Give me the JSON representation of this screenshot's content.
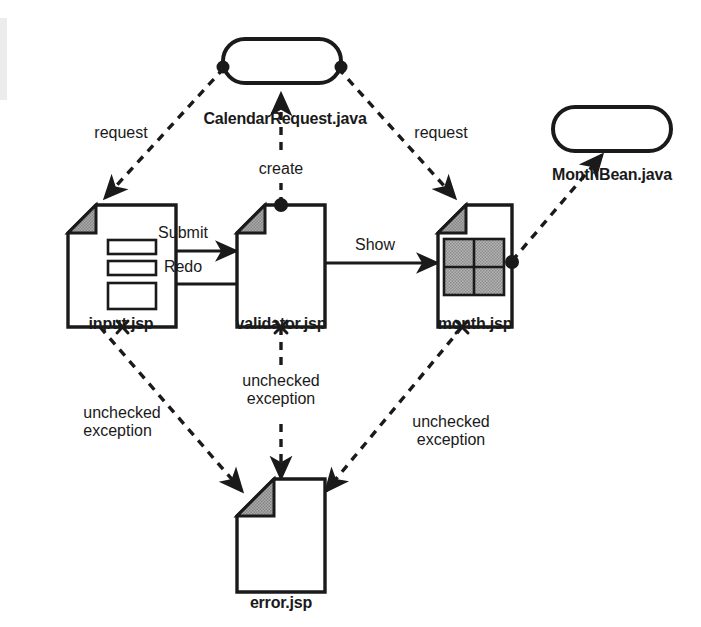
{
  "diagram": {
    "type": "uml-component-navigation",
    "colors": {
      "stroke": "#1a1a1a",
      "background": "#ffffff",
      "fold_fill": "#9a9a9a",
      "grid_fill": "#a8a8a8",
      "text": "#1a1a1a"
    },
    "nodes": [
      {
        "id": "calendarRequest",
        "label": "CalendarRequest.java",
        "shape": "rounded-rectangle",
        "kind": "java-bean"
      },
      {
        "id": "monthBean",
        "label": "MonthBean.java",
        "shape": "rounded-rectangle",
        "kind": "java-bean"
      },
      {
        "id": "inputJsp",
        "label": "input.jsp",
        "shape": "document",
        "kind": "jsp-page",
        "contents": "form-fields"
      },
      {
        "id": "validatorJsp",
        "label": "validator.jsp",
        "shape": "document",
        "kind": "jsp-page",
        "contents": "empty"
      },
      {
        "id": "monthJsp",
        "label": "month.jsp",
        "shape": "document",
        "kind": "jsp-page",
        "contents": "calendar-grid"
      },
      {
        "id": "errorJsp",
        "label": "error.jsp",
        "shape": "document",
        "kind": "jsp-page",
        "contents": "empty"
      }
    ],
    "edges": [
      {
        "id": "e1",
        "from": "calendarRequest",
        "to": "inputJsp",
        "label": "request",
        "style": "dashed"
      },
      {
        "id": "e2",
        "from": "calendarRequest",
        "to": "monthJsp",
        "label": "request",
        "style": "dashed"
      },
      {
        "id": "e3",
        "from": "validatorJsp",
        "to": "calendarRequest",
        "label": "create",
        "style": "dashed"
      },
      {
        "id": "e4",
        "from": "monthJsp",
        "to": "monthBean",
        "label": "",
        "style": "dashed"
      },
      {
        "id": "e5",
        "from": "inputJsp",
        "to": "validatorJsp",
        "label": "Submit",
        "style": "solid"
      },
      {
        "id": "e6",
        "from": "validatorJsp",
        "to": "inputJsp",
        "label": "Redo",
        "style": "solid"
      },
      {
        "id": "e7",
        "from": "validatorJsp",
        "to": "monthJsp",
        "label": "Show",
        "style": "solid"
      },
      {
        "id": "e8",
        "from": "inputJsp",
        "to": "errorJsp",
        "label": "unchecked exception",
        "style": "dashed"
      },
      {
        "id": "e9",
        "from": "validatorJsp",
        "to": "errorJsp",
        "label": "unchecked exception",
        "style": "dashed"
      },
      {
        "id": "e10",
        "from": "monthJsp",
        "to": "errorJsp",
        "label": "unchecked exception",
        "style": "dashed"
      }
    ],
    "labels": {
      "calendar_request": "CalendarRequest.java",
      "month_bean": "MonthBean.java",
      "input_jsp": "input.jsp",
      "validator_jsp": "validator.jsp",
      "month_jsp": "month.jsp",
      "error_jsp": "error.jsp",
      "request_left": "request",
      "request_right": "request",
      "create": "create",
      "submit": "Submit",
      "redo": "Redo",
      "show": "Show",
      "unchecked_exception_left_l1": "unchecked",
      "unchecked_exception_left_l2": "exception",
      "unchecked_exception_mid_l1": "unchecked",
      "unchecked_exception_mid_l2": "exception",
      "unchecked_exception_right_l1": "unchecked",
      "unchecked_exception_right_l2": "exception"
    }
  }
}
